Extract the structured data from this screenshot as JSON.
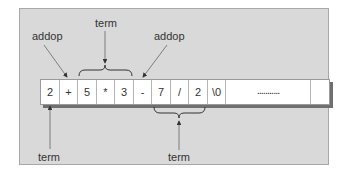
{
  "diagram": {
    "cells": [
      {
        "text": "2",
        "width": 19
      },
      {
        "text": "+",
        "width": 18
      },
      {
        "text": "5",
        "width": 19
      },
      {
        "text": "*",
        "width": 18
      },
      {
        "text": "3",
        "width": 19
      },
      {
        "text": "-",
        "width": 18
      },
      {
        "text": "7",
        "width": 19
      },
      {
        "text": "/",
        "width": 18
      },
      {
        "text": "2",
        "width": 19
      },
      {
        "text": "\\0",
        "width": 18
      },
      {
        "text": "...........",
        "width": 85
      },
      {
        "text": "",
        "width": 18
      }
    ],
    "labels": {
      "addop_left": "addop",
      "term_top": "term",
      "addop_right": "addop",
      "term_bottom_left": "term",
      "term_bottom_right": "term"
    },
    "colors": {
      "panel": "#d9d9d9",
      "cell_bg": "#ffffff",
      "shadow": "#6f6f6f",
      "arrow": "#555555"
    }
  }
}
